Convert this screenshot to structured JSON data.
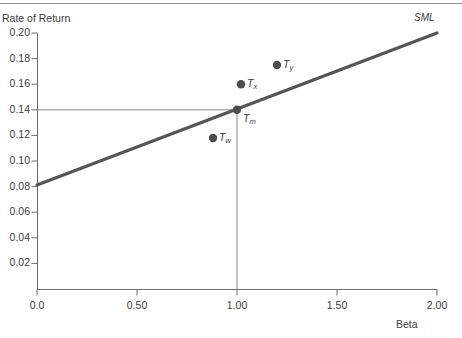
{
  "chart_data": {
    "type": "line",
    "title": "",
    "xlabel": "Beta",
    "ylabel": "Rate of Return",
    "xlim": [
      0.0,
      2.0
    ],
    "ylim": [
      0.0,
      0.2
    ],
    "grid": false,
    "legend": "none",
    "xticks": [
      "0.0",
      "0.50",
      "1.00",
      "1.50",
      "2.00"
    ],
    "xtick_values": [
      0.0,
      0.5,
      1.0,
      1.5,
      2.0
    ],
    "yticks": [
      "0.02",
      "0.04",
      "0.06",
      "0.08",
      "0.10",
      "0.12",
      "0.14",
      "0.16",
      "0.18",
      "0.20"
    ],
    "ytick_values": [
      0.02,
      0.04,
      0.06,
      0.08,
      0.1,
      0.12,
      0.14,
      0.16,
      0.18,
      0.2
    ],
    "series": [
      {
        "name": "SML",
        "type": "line",
        "label": "SML",
        "color": "#555555",
        "x": [
          0.0,
          2.0
        ],
        "values": [
          0.08,
          0.2
        ],
        "intercept": 0.08,
        "slope": 0.06
      }
    ],
    "points": [
      {
        "name": "Tm",
        "label": "T",
        "subscript": "m",
        "beta": 1.0,
        "return": 0.14,
        "color": "#4d4d4d"
      },
      {
        "name": "Tx",
        "label": "T",
        "subscript": "x",
        "beta": 1.02,
        "return": 0.16,
        "color": "#4d4d4d"
      },
      {
        "name": "Ty",
        "label": "T",
        "subscript": "y",
        "beta": 1.2,
        "return": 0.175,
        "color": "#4d4d4d"
      },
      {
        "name": "Tw",
        "label": "T",
        "subscript": "w",
        "beta": 0.88,
        "return": 0.118,
        "color": "#4d4d4d"
      }
    ],
    "annotations": [
      {
        "name": "market-return-guide",
        "type": "horizontal-line",
        "y": 0.14,
        "x_from": 0.0,
        "x_to": 1.0
      },
      {
        "name": "market-beta-guide",
        "type": "vertical-line",
        "x": 1.0,
        "y_from": 0.0,
        "y_to": 0.14
      }
    ]
  },
  "colors": {
    "sml_line": "#555555",
    "point": "#4d4d4d",
    "axis": "#6b6b6b",
    "guide": "#8a8a8a",
    "text": "#3c3c3c",
    "top_rule": "#8c8c8c"
  },
  "labels": {
    "y_axis_title": "Rate of Return",
    "x_axis_title": "Beta",
    "sml": "SML"
  }
}
